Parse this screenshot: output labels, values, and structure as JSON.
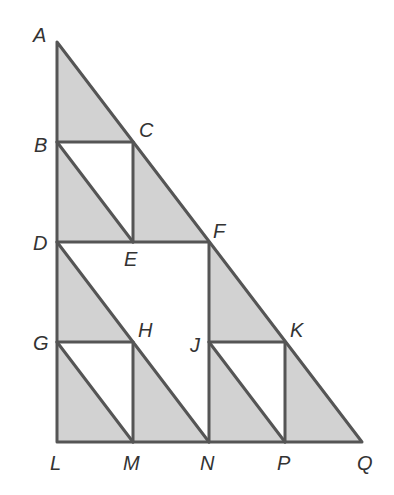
{
  "diagram": {
    "type": "geometry-figure",
    "colors": {
      "shade": "#d2d2d2",
      "stroke": "#555555",
      "label": "#333333",
      "background": "#ffffff"
    },
    "points": {
      "A": {
        "label": "A",
        "x": 57,
        "y": 42
      },
      "B": {
        "label": "B",
        "x": 57,
        "y": 142
      },
      "C": {
        "label": "C",
        "x": 133,
        "y": 142
      },
      "D": {
        "label": "D",
        "x": 57,
        "y": 242
      },
      "E": {
        "label": "E",
        "x": 133,
        "y": 242
      },
      "F": {
        "label": "F",
        "x": 209,
        "y": 242
      },
      "G": {
        "label": "G",
        "x": 57,
        "y": 342
      },
      "H": {
        "label": "H",
        "x": 133,
        "y": 342
      },
      "J": {
        "label": "J",
        "x": 209,
        "y": 342
      },
      "K": {
        "label": "K",
        "x": 285,
        "y": 342
      },
      "L": {
        "label": "L",
        "x": 57,
        "y": 442
      },
      "M": {
        "label": "M",
        "x": 133,
        "y": 442
      },
      "N": {
        "label": "N",
        "x": 209,
        "y": 442
      },
      "P": {
        "label": "P",
        "x": 285,
        "y": 442
      },
      "Q": {
        "label": "Q",
        "x": 362,
        "y": 442
      }
    },
    "shaded_triangles": [
      [
        "A",
        "B",
        "C"
      ],
      [
        "B",
        "D",
        "E"
      ],
      [
        "C",
        "E",
        "F"
      ],
      [
        "D",
        "G",
        "H"
      ],
      [
        "G",
        "L",
        "M"
      ],
      [
        "H",
        "M",
        "N"
      ],
      [
        "F",
        "J",
        "K"
      ],
      [
        "J",
        "N",
        "P"
      ],
      [
        "K",
        "P",
        "Q"
      ]
    ],
    "labels": {
      "A": "A",
      "B": "B",
      "C": "C",
      "D": "D",
      "E": "E",
      "F": "F",
      "G": "G",
      "H": "H",
      "J": "J",
      "K": "K",
      "L": "L",
      "M": "M",
      "N": "N",
      "P": "P",
      "Q": "Q"
    }
  }
}
